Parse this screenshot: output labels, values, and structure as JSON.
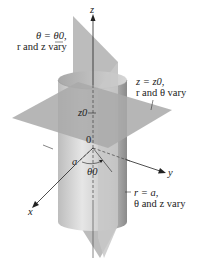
{
  "figure": {
    "type": "cylindrical-coordinate-surfaces",
    "axes": {
      "z": "z",
      "x": "x",
      "y": "y"
    },
    "origin": "0",
    "marks": {
      "height": "z0",
      "radius": "a",
      "angle": "θ0"
    },
    "surfaces": [
      {
        "id": "half-plane",
        "equation": "θ = θ0,",
        "note": "r and z vary"
      },
      {
        "id": "horizontal-plane",
        "equation": "z = z0,",
        "note": "r and θ vary"
      },
      {
        "id": "cylinder",
        "equation": "r = a,",
        "note": "θ and z vary"
      }
    ],
    "colors": {
      "plane": "#b4b4b4",
      "cylinder_light": "#d8d8d8",
      "cylinder_dark": "#8c8c8c",
      "ink": "#222222"
    }
  }
}
